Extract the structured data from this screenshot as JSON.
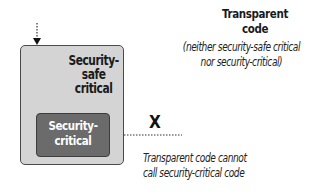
{
  "diagram": {
    "type": "security-transparency-model",
    "outer_box": {
      "label": "Security-safe critical",
      "label_lines": [
        "Security-",
        "safe",
        "critical"
      ],
      "fill": "#d4d4d4"
    },
    "inner_box": {
      "label": "Security-critical",
      "label_lines": [
        "Security-",
        "critical"
      ],
      "fill": "#6b6b6b"
    },
    "transparent_code": {
      "title_lines": [
        "Transparent",
        "code"
      ],
      "description_lines": [
        "(neither security-safe critical",
        "nor security-critical)"
      ]
    },
    "blocked_call": {
      "marker": "X",
      "note_lines": [
        "Transparent code cannot",
        "call security-critical code"
      ]
    },
    "arrows": [
      {
        "from": "above",
        "to": "outer_box",
        "style": "dotted"
      },
      {
        "from": "outer_box",
        "to": "inner_box",
        "style": "dotted"
      },
      {
        "from": "transparent_code",
        "to": "inner_box",
        "style": "dotted",
        "blocked": true
      }
    ]
  }
}
